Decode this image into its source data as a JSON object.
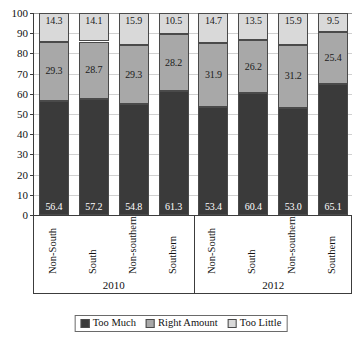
{
  "chart_data": {
    "type": "bar",
    "subtype": "stacked-percent",
    "title": "",
    "xlabel": "",
    "ylabel": "",
    "ylim": [
      0,
      100
    ],
    "yticks": [
      0,
      10,
      20,
      30,
      40,
      50,
      60,
      70,
      80,
      90,
      100
    ],
    "grid": true,
    "legend_position": "bottom",
    "categories": [
      "Non-South",
      "South",
      "Non-southern",
      "Southern",
      "Non-South",
      "South",
      "Non-southern",
      "Southern"
    ],
    "groups": [
      {
        "label": "2010",
        "categories": [
          "Non-South",
          "South",
          "Non-southern",
          "Southern"
        ]
      },
      {
        "label": "2012",
        "categories": [
          "Non-South",
          "South",
          "Non-southern",
          "Southern"
        ]
      }
    ],
    "series": [
      {
        "name": "Too Much",
        "color": "#3a3a3a",
        "values": [
          56.4,
          57.2,
          54.8,
          61.3,
          53.4,
          60.4,
          53.0,
          65.1
        ]
      },
      {
        "name": "Right Amount",
        "color": "#a8a8a8",
        "values": [
          29.3,
          28.7,
          29.3,
          28.2,
          31.9,
          26.2,
          31.2,
          25.4
        ]
      },
      {
        "name": "Too Little",
        "color": "#d9d9d9",
        "values": [
          14.3,
          14.1,
          15.9,
          10.5,
          14.7,
          13.5,
          15.9,
          9.5
        ]
      }
    ],
    "bars": [
      {
        "category": "Non-South",
        "group": "2010",
        "too_much": 56.4,
        "right_amount": 29.3,
        "too_little": 14.3
      },
      {
        "category": "South",
        "group": "2010",
        "too_much": 57.2,
        "right_amount": 28.7,
        "too_little": 14.1
      },
      {
        "category": "Non-southern",
        "group": "2010",
        "too_much": 54.8,
        "right_amount": 29.3,
        "too_little": 15.9
      },
      {
        "category": "Southern",
        "group": "2010",
        "too_much": 61.3,
        "right_amount": 28.2,
        "too_little": 10.5
      },
      {
        "category": "Non-South",
        "group": "2012",
        "too_much": 53.4,
        "right_amount": 31.9,
        "too_little": 14.7
      },
      {
        "category": "South",
        "group": "2012",
        "too_much": 60.4,
        "right_amount": 26.2,
        "too_little": 13.5
      },
      {
        "category": "Non-southern",
        "group": "2012",
        "too_much": 53.0,
        "right_amount": 31.2,
        "too_little": 15.9
      },
      {
        "category": "Southern",
        "group": "2012",
        "too_much": 65.1,
        "right_amount": 25.4,
        "too_little": 9.5
      }
    ],
    "legend": [
      {
        "label": "Too Much",
        "color": "#3a3a3a"
      },
      {
        "label": "Right Amount",
        "color": "#a8a8a8"
      },
      {
        "label": "Too Little",
        "color": "#d9d9d9"
      }
    ]
  }
}
